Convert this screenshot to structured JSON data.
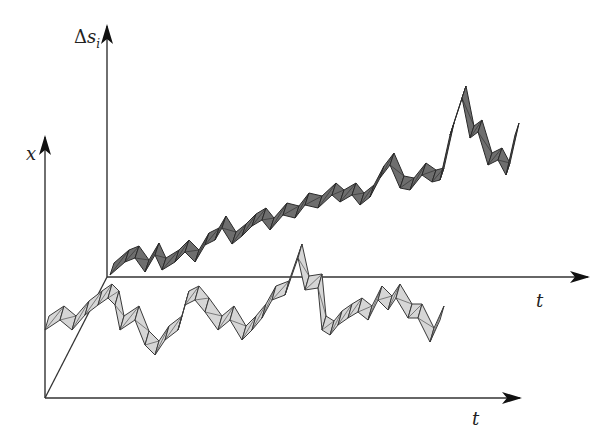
{
  "figure": {
    "type": "3d-ribbon-time-series-diagram",
    "colors": {
      "axis": "#333333",
      "dark_ribbon_fill": "#6e6e6e",
      "dark_ribbon_edge": "#2a2a2a",
      "light_ribbon_fill": "#d6d6d6",
      "light_ribbon_edge": "#3a3a3a"
    },
    "back_frame": {
      "y_label_symbol": "Δ",
      "y_label_var": "s",
      "y_label_sub": "i",
      "x_label": "t"
    },
    "front_frame": {
      "y_label": "x",
      "x_label": "t"
    },
    "series": [
      {
        "name": "Δs_i ribbon (dark, back plane)",
        "points": [
          [
            110,
            275
          ],
          [
            125,
            262
          ],
          [
            135,
            258
          ],
          [
            145,
            272
          ],
          [
            155,
            255
          ],
          [
            162,
            270
          ],
          [
            175,
            262
          ],
          [
            185,
            252
          ],
          [
            195,
            262
          ],
          [
            205,
            245
          ],
          [
            215,
            240
          ],
          [
            222,
            228
          ],
          [
            232,
            244
          ],
          [
            242,
            236
          ],
          [
            252,
            226
          ],
          [
            262,
            220
          ],
          [
            270,
            230
          ],
          [
            283,
            215
          ],
          [
            295,
            218
          ],
          [
            305,
            205
          ],
          [
            318,
            208
          ],
          [
            332,
            195
          ],
          [
            340,
            202
          ],
          [
            352,
            195
          ],
          [
            360,
            205
          ],
          [
            370,
            197
          ],
          [
            380,
            178
          ],
          [
            390,
            165
          ],
          [
            400,
            188
          ],
          [
            410,
            190
          ],
          [
            422,
            175
          ],
          [
            432,
            182
          ],
          [
            440,
            180
          ],
          [
            450,
            135
          ],
          [
            462,
            98
          ],
          [
            470,
            138
          ],
          [
            478,
            132
          ],
          [
            488,
            165
          ],
          [
            498,
            160
          ],
          [
            506,
            175
          ],
          [
            515,
            135
          ]
        ]
      },
      {
        "name": "x ribbon (light, front plane)",
        "points": [
          [
            45,
            330
          ],
          [
            60,
            320
          ],
          [
            72,
            330
          ],
          [
            85,
            315
          ],
          [
            98,
            305
          ],
          [
            108,
            298
          ],
          [
            115,
            305
          ],
          [
            120,
            330
          ],
          [
            135,
            320
          ],
          [
            145,
            345
          ],
          [
            155,
            355
          ],
          [
            165,
            340
          ],
          [
            178,
            330
          ],
          [
            185,
            305
          ],
          [
            195,
            300
          ],
          [
            205,
            312
          ],
          [
            218,
            330
          ],
          [
            230,
            320
          ],
          [
            242,
            340
          ],
          [
            252,
            330
          ],
          [
            262,
            318
          ],
          [
            272,
            300
          ],
          [
            285,
            295
          ],
          [
            298,
            258
          ],
          [
            305,
            290
          ],
          [
            318,
            288
          ],
          [
            322,
            330
          ],
          [
            330,
            335
          ],
          [
            338,
            325
          ],
          [
            348,
            318
          ],
          [
            358,
            312
          ],
          [
            368,
            320
          ],
          [
            378,
            300
          ],
          [
            388,
            310
          ],
          [
            396,
            298
          ],
          [
            408,
            318
          ],
          [
            418,
            318
          ],
          [
            430,
            342
          ],
          [
            440,
            320
          ]
        ]
      }
    ]
  }
}
